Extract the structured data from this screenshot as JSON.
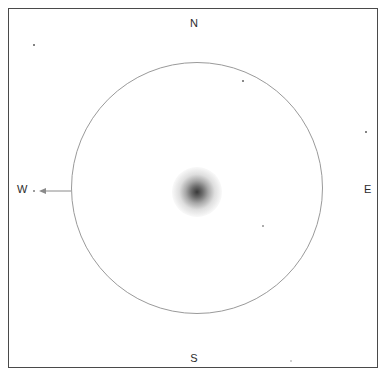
{
  "header": {
    "cut_off_text": ""
  },
  "chart": {
    "title": "",
    "frame": {
      "x": 8,
      "y": 8,
      "width": 370,
      "height": 360,
      "border_color": "#4a4a4a"
    },
    "background_color": "#ffffff"
  },
  "cardinals": {
    "north": "N",
    "south": "S",
    "west": "W",
    "east": "E"
  },
  "chart_data": {
    "type": "scatter",
    "title": "",
    "subtitle": "",
    "xlabel": "",
    "ylabel": "",
    "grid": false,
    "legend_position": "none",
    "orientation": {
      "north": "up",
      "south": "down",
      "west": "left",
      "east": "right"
    },
    "field_of_view_circle": {
      "center_x": 196,
      "center_y": 187,
      "radius": 126,
      "stroke_color": "#9a9a9a"
    },
    "direction_arrow": {
      "label": "W",
      "points": "west",
      "from_x": 71,
      "from_y": 190,
      "to_x": 38,
      "to_y": 190,
      "color": "#8a8a8a"
    },
    "deep_sky_object": {
      "name": "diffuse-nebulosity",
      "center_x": 196,
      "center_y": 191,
      "radius": 25,
      "peak_color": "#282828",
      "profile": "gaussian"
    },
    "stars": [
      {
        "x": 33,
        "y": 44,
        "size": 2.2,
        "brightness": 0.85
      },
      {
        "x": 242,
        "y": 80,
        "size": 2.0,
        "brightness": 0.8
      },
      {
        "x": 365,
        "y": 131,
        "size": 2.2,
        "brightness": 0.85
      },
      {
        "x": 33,
        "y": 190,
        "size": 1.6,
        "brightness": 0.6
      },
      {
        "x": 262,
        "y": 225,
        "size": 1.8,
        "brightness": 0.55
      },
      {
        "x": 290,
        "y": 360,
        "size": 1.6,
        "brightness": 0.28
      }
    ]
  }
}
